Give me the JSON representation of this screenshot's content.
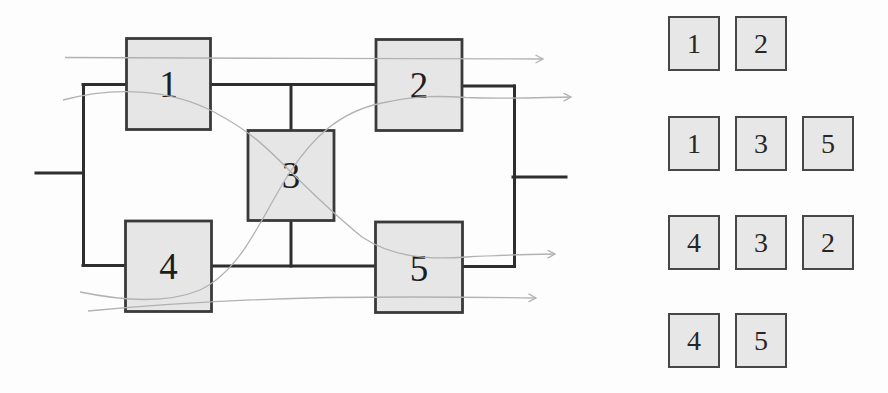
{
  "colors": {
    "background": "#fdfdfd",
    "block_fill": "#e6e6e6",
    "block_border": "#3a3a3a",
    "rail": "#2e2e2e",
    "flow_arrow": "#b2b2b2",
    "text": "#1e1e1e"
  },
  "diagram": {
    "type": "reliability-block-diagram-bridge",
    "blocks": [
      {
        "label": "1"
      },
      {
        "label": "2"
      },
      {
        "label": "3"
      },
      {
        "label": "4"
      },
      {
        "label": "5"
      }
    ],
    "flow_paths": [
      {
        "name": "path-1-2",
        "through": [
          "1",
          "2"
        ]
      },
      {
        "name": "path-1-3-5",
        "through": [
          "1",
          "3",
          "5"
        ]
      },
      {
        "name": "path-4-3-2",
        "through": [
          "4",
          "3",
          "2"
        ]
      },
      {
        "name": "path-4-5",
        "through": [
          "4",
          "5"
        ]
      }
    ]
  },
  "path_sets": {
    "rows": [
      {
        "blocks": [
          "1",
          "2"
        ]
      },
      {
        "blocks": [
          "1",
          "3",
          "5"
        ]
      },
      {
        "blocks": [
          "4",
          "3",
          "2"
        ]
      },
      {
        "blocks": [
          "4",
          "5"
        ]
      }
    ]
  }
}
